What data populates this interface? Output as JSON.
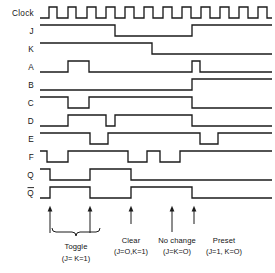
{
  "figure": {
    "kind": "digital-timing-diagram",
    "stroke_color": "#1b1b1b",
    "background_color": "#ffffff",
    "clock_pulse_count": 6
  },
  "rows": [
    {
      "label": "Clock",
      "name": "clock"
    },
    {
      "label": "J",
      "name": "j"
    },
    {
      "label": "K",
      "name": "k"
    },
    {
      "label": "A",
      "name": "a"
    },
    {
      "label": "B",
      "name": "b"
    },
    {
      "label": "C",
      "name": "c"
    },
    {
      "label": "D",
      "name": "d"
    },
    {
      "label": "E",
      "name": "e"
    },
    {
      "label": "F",
      "name": "f"
    },
    {
      "label": "Q",
      "name": "q"
    },
    {
      "label": "Q",
      "name": "q-bar",
      "overbar": true
    }
  ],
  "annotations": [
    {
      "name": "toggle",
      "title": "Toggle",
      "detail": "(J= K=1)"
    },
    {
      "name": "clear",
      "title": "Clear",
      "detail": "(J=O,K=1)"
    },
    {
      "name": "no-change",
      "title": "No change",
      "detail": "(J=K=O)"
    },
    {
      "name": "preset",
      "title": "Preset",
      "detail": "(J=1, K=O)"
    }
  ],
  "chart_data": {
    "type": "line",
    "title": "",
    "xlabel": "",
    "ylabel": "",
    "x_axis_px": {
      "start": 40,
      "end": 272
    },
    "signals": [
      {
        "name": "Clock",
        "transitions_px": [
          40,
          49,
          57,
          68,
          76,
          87,
          96,
          106,
          115,
          125,
          134,
          144,
          153,
          163,
          172,
          182,
          191,
          201,
          210,
          220,
          229,
          239,
          248,
          258,
          267,
          272
        ],
        "initial": 0
      },
      {
        "name": "J",
        "transitions_px": [
          40,
          115,
          192,
          272
        ],
        "initial": 1
      },
      {
        "name": "K",
        "transitions_px": [
          40,
          152,
          272
        ],
        "initial": 1
      },
      {
        "name": "A",
        "transitions_px": [
          40,
          68,
          89,
          192,
          200,
          272
        ],
        "initial": 0
      },
      {
        "name": "B",
        "transitions_px": [
          40,
          192,
          272
        ],
        "initial": 0
      },
      {
        "name": "C",
        "transitions_px": [
          40,
          68,
          89,
          192,
          272
        ],
        "initial": 1
      },
      {
        "name": "D",
        "transitions_px": [
          40,
          68,
          106,
          115,
          192,
          272
        ],
        "initial": 0
      },
      {
        "name": "E",
        "transitions_px": [
          40,
          90,
          108,
          200,
          218,
          272
        ],
        "initial": 1
      },
      {
        "name": "F",
        "transitions_px": [
          40,
          47,
          68,
          128,
          147,
          160,
          180,
          272
        ],
        "initial": 1
      },
      {
        "name": "Q",
        "transitions_px": [
          40,
          50,
          90,
          131,
          272
        ],
        "initial": 1
      },
      {
        "name": "Qbar",
        "transitions_px": [
          40,
          50,
          90,
          131,
          192,
          272
        ],
        "initial": 0
      }
    ],
    "event_markers_px": [
      50,
      90,
      131,
      172,
      194
    ]
  }
}
